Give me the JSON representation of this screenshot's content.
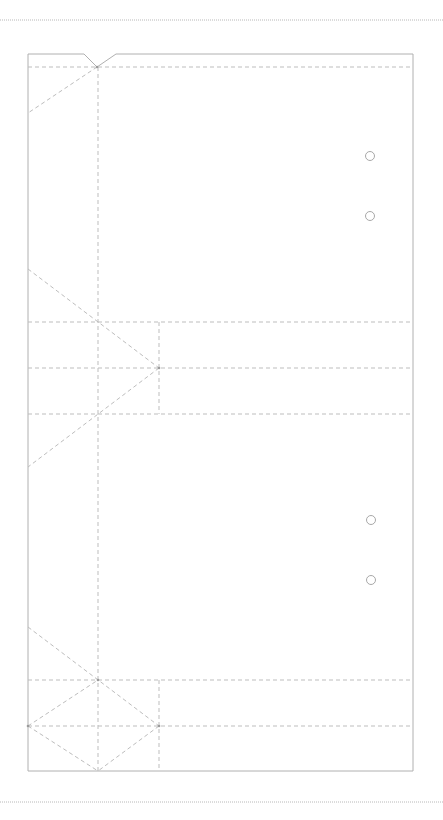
{
  "diagram": {
    "title": "",
    "type": "folding-template",
    "colors": {
      "background": "#ffffff",
      "cut_line": "#b0b0b0",
      "fold_line": "#bdbdbd",
      "page_edge": "#b8b8b8"
    },
    "page_edges": [
      {
        "name": "top-page-edge",
        "x1": 0,
        "y1": 20,
        "x2": 443,
        "y2": 20
      },
      {
        "name": "bottom-page-edge",
        "x1": 0,
        "y1": 802,
        "x2": 443,
        "y2": 802
      }
    ],
    "outline": {
      "name": "template-outline",
      "points": "28,54 84,54 97,67 116,54 413,54 413,771 28,771 28,54"
    },
    "fold_lines": [
      {
        "name": "fold-top-horizontal",
        "x1": 28,
        "y1": 67,
        "x2": 413,
        "y2": 67
      },
      {
        "name": "fold-spine-vertical",
        "x1": 98,
        "y1": 67,
        "x2": 98,
        "y2": 771
      },
      {
        "name": "fold-top-diagonal",
        "x1": 97,
        "y1": 67,
        "x2": 28,
        "y2": 113
      },
      {
        "name": "fold-mid-diagonal-a",
        "x1": 28,
        "y1": 269,
        "x2": 159,
        "y2": 368
      },
      {
        "name": "fold-mid-diagonal-b",
        "x1": 159,
        "y1": 368,
        "x2": 28,
        "y2": 467
      },
      {
        "name": "fold-mid-horizontal-1",
        "x1": 28,
        "y1": 322,
        "x2": 413,
        "y2": 322
      },
      {
        "name": "fold-mid-horizontal-2",
        "x1": 28,
        "y1": 368,
        "x2": 413,
        "y2": 368
      },
      {
        "name": "fold-mid-horizontal-3",
        "x1": 28,
        "y1": 414,
        "x2": 413,
        "y2": 414
      },
      {
        "name": "fold-mid-vertical",
        "x1": 159,
        "y1": 322,
        "x2": 159,
        "y2": 414
      },
      {
        "name": "fold-bottom-diagonal-a",
        "x1": 28,
        "y1": 627,
        "x2": 159,
        "y2": 726
      },
      {
        "name": "fold-bottom-diagonal-b",
        "x1": 159,
        "y1": 726,
        "x2": 98,
        "y2": 771
      },
      {
        "name": "fold-bottom-diagonal-c",
        "x1": 28,
        "y1": 726,
        "x2": 98,
        "y2": 680
      },
      {
        "name": "fold-bottom-diagonal-d",
        "x1": 28,
        "y1": 726,
        "x2": 98,
        "y2": 771
      },
      {
        "name": "fold-bottom-horizontal-1",
        "x1": 28,
        "y1": 680,
        "x2": 413,
        "y2": 680
      },
      {
        "name": "fold-bottom-horizontal-2",
        "x1": 28,
        "y1": 726,
        "x2": 413,
        "y2": 726
      },
      {
        "name": "fold-bottom-vertical",
        "x1": 159,
        "y1": 680,
        "x2": 159,
        "y2": 771
      }
    ],
    "nodes": [
      {
        "name": "node-top-notch",
        "cx": 97,
        "cy": 67
      },
      {
        "name": "node-mid-right",
        "cx": 159,
        "cy": 368
      },
      {
        "name": "node-bottom-right",
        "cx": 159,
        "cy": 726
      },
      {
        "name": "node-bottom-left",
        "cx": 28,
        "cy": 726
      },
      {
        "name": "node-bottom-spine",
        "cx": 98,
        "cy": 680
      }
    ],
    "holes": [
      {
        "name": "punch-hole-1",
        "cx": 370,
        "cy": 156,
        "r": 4.5
      },
      {
        "name": "punch-hole-2",
        "cx": 370,
        "cy": 216,
        "r": 4.5
      },
      {
        "name": "punch-hole-3",
        "cx": 371,
        "cy": 520,
        "r": 4.5
      },
      {
        "name": "punch-hole-4",
        "cx": 371,
        "cy": 580,
        "r": 4.5
      }
    ]
  }
}
